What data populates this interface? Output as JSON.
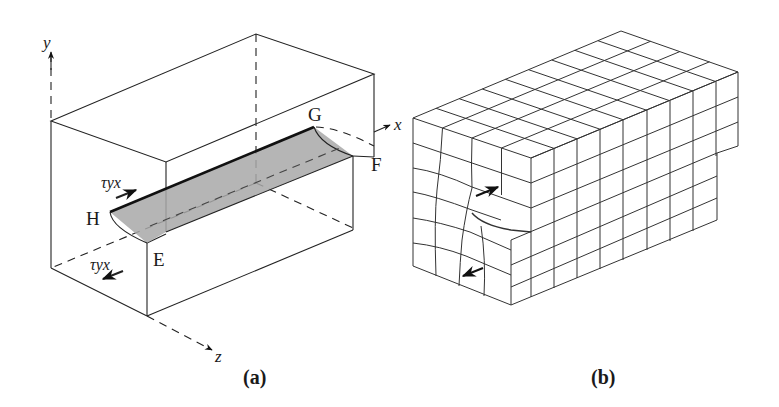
{
  "figure": {
    "panels": [
      {
        "id": "a",
        "caption": "(a)",
        "axes": {
          "x": "x",
          "y": "y",
          "z": "z"
        },
        "points": {
          "H": "H",
          "E": "E",
          "F": "F",
          "G": "G"
        },
        "stress_labels": [
          "τyx",
          "τyx"
        ],
        "shaded_surface": "HEFG",
        "colors": {
          "line": "#222222",
          "shade": "#a8a8a8"
        }
      },
      {
        "id": "b",
        "caption": "(b)",
        "description": "Deformed grid mesh of block with screw dislocation",
        "grid": {
          "front_columns": 4,
          "front_rows": 6,
          "side_columns": 9,
          "side_rows": 6,
          "top_rows": 4
        },
        "colors": {
          "line": "#333333"
        }
      }
    ]
  }
}
